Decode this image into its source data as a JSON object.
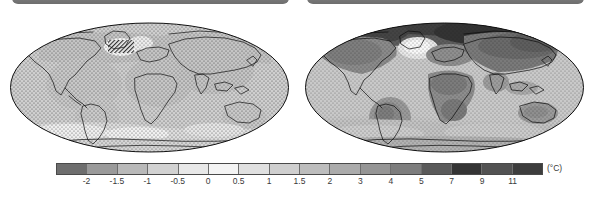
{
  "figure": {
    "panels": [
      {
        "id": "left",
        "title": "",
        "description": "global map of temperature change, weak signal, stippled"
      },
      {
        "id": "right",
        "title": "",
        "description": "global map of temperature change, strong warming, stippled"
      }
    ]
  },
  "colorbar": {
    "unit_label": "(°C)",
    "orientation": "horizontal",
    "tick_labels": [
      "-2",
      "-1.5",
      "-1",
      "-0.5",
      "0",
      "0.5",
      "1",
      "1.5",
      "2",
      "3",
      "4",
      "5",
      "7",
      "9",
      "11"
    ],
    "segment_colors": [
      "#6e6e6e",
      "#9a9a9a",
      "#b9b9b9",
      "#d2d2d2",
      "#e8e8e8",
      "#f4f4f4",
      "#e0e0e0",
      "#cfcfcf",
      "#bdbdbd",
      "#ababab",
      "#959595",
      "#7d7d7d",
      "#5a5a5a",
      "#343434",
      "#525252",
      "#3d3d3d"
    ]
  },
  "chart_data": {
    "type": "heatmap",
    "title": "",
    "subtitle": "",
    "xlabel": "",
    "ylabel": "",
    "projection": "Hammer / elliptical global projection",
    "grid": false,
    "legend_position": "bottom",
    "colorbar_unit": "(°C)",
    "colorbar_ticks": [
      -2,
      -1.5,
      -1,
      -0.5,
      0,
      0.5,
      1,
      1.5,
      2,
      3,
      4,
      5,
      7,
      9,
      11
    ],
    "colorbar_range": [
      -2.5,
      13
    ],
    "colormap": "grayscale (dark = cold at low end, white near 0.5, dark = hot at high end)",
    "stippling": "dot hatching overlaid where change is statistically significant",
    "panels": [
      {
        "name": "left-map",
        "label": "",
        "value_range": [
          -1.0,
          1.5
        ],
        "regions": [
          {
            "region": "Global mean",
            "value": 0.3
          },
          {
            "region": "Arctic / North Pole",
            "value": 0.6
          },
          {
            "region": "North Atlantic (subpolar gyre)",
            "value": -1.2
          },
          {
            "region": "North America",
            "value": 0.3
          },
          {
            "region": "South America",
            "value": 0.4
          },
          {
            "region": "Africa",
            "value": 0.4
          },
          {
            "region": "Europe",
            "value": 0.4
          },
          {
            "region": "Asia",
            "value": 0.4
          },
          {
            "region": "Australia",
            "value": 0.4
          },
          {
            "region": "Southern Ocean",
            "value": 0.1
          },
          {
            "region": "Antarctica",
            "value": 0.2
          }
        ]
      },
      {
        "name": "right-map",
        "label": "",
        "value_range": [
          0.5,
          12
        ],
        "regions": [
          {
            "region": "Global mean",
            "value": 3.0
          },
          {
            "region": "Arctic / North Pole",
            "value": 11.0
          },
          {
            "region": "North Atlantic (subpolar gyre)",
            "value": 1.0
          },
          {
            "region": "North America",
            "value": 5.0
          },
          {
            "region": "Amazon / South America",
            "value": 4.5
          },
          {
            "region": "Africa (Sahara / central)",
            "value": 5.0
          },
          {
            "region": "Europe",
            "value": 4.0
          },
          {
            "region": "Central Asia / Siberia",
            "value": 7.0
          },
          {
            "region": "Australia",
            "value": 3.0
          },
          {
            "region": "Southern Ocean",
            "value": 1.5
          },
          {
            "region": "Antarctica",
            "value": 2.5
          }
        ]
      }
    ]
  }
}
